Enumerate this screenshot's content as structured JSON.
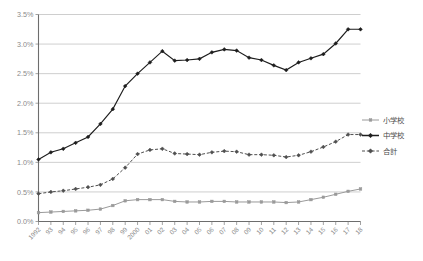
{
  "chart_data": {
    "type": "line",
    "title": "",
    "xlabel": "",
    "ylabel": "",
    "ylim": [
      0,
      3.5
    ],
    "ytick_values": [
      0,
      0.5,
      1.0,
      1.5,
      2.0,
      2.5,
      3.0,
      3.5
    ],
    "ytick_labels": [
      "0.0%",
      "0.5%",
      "1.0%",
      "1.5%",
      "2.0%",
      "2.5%",
      "3.0%",
      "3.5%"
    ],
    "grid": true,
    "legend_position": "right",
    "categories": [
      "1992",
      "93",
      "94",
      "95",
      "96",
      "97",
      "98",
      "99",
      "2000",
      "01",
      "02",
      "03",
      "04",
      "05",
      "06",
      "07",
      "08",
      "09",
      "10",
      "11",
      "12",
      "13",
      "14",
      "15",
      "16",
      "17",
      "18"
    ],
    "series": [
      {
        "name": "小学校",
        "color": "#9a9a9a",
        "marker": "square",
        "dash": "solid",
        "values": [
          0.15,
          0.16,
          0.17,
          0.18,
          0.19,
          0.21,
          0.27,
          0.35,
          0.37,
          0.37,
          0.37,
          0.34,
          0.33,
          0.33,
          0.34,
          0.34,
          0.33,
          0.33,
          0.33,
          0.33,
          0.32,
          0.33,
          0.37,
          0.41,
          0.46,
          0.51,
          0.55
        ]
      },
      {
        "name": "中学校",
        "color": "#1d1d1d",
        "marker": "diamond",
        "dash": "solid",
        "values": [
          1.05,
          1.17,
          1.23,
          1.33,
          1.43,
          1.65,
          1.9,
          2.29,
          2.5,
          2.69,
          2.88,
          2.72,
          2.73,
          2.75,
          2.86,
          2.91,
          2.89,
          2.77,
          2.73,
          2.64,
          2.56,
          2.69,
          2.76,
          2.83,
          3.01,
          3.25,
          3.25
        ]
      },
      {
        "name": "合計",
        "color": "#4f4f4f",
        "marker": "diamond",
        "dash": "dashed",
        "values": [
          0.47,
          0.5,
          0.52,
          0.55,
          0.58,
          0.62,
          0.72,
          0.91,
          1.14,
          1.21,
          1.23,
          1.15,
          1.14,
          1.13,
          1.17,
          1.19,
          1.18,
          1.13,
          1.13,
          1.12,
          1.09,
          1.12,
          1.18,
          1.26,
          1.35,
          1.47,
          1.47
        ]
      }
    ]
  },
  "legend": {
    "items": [
      {
        "label": "小学校"
      },
      {
        "label": "中学校"
      },
      {
        "label": "合計"
      }
    ]
  }
}
